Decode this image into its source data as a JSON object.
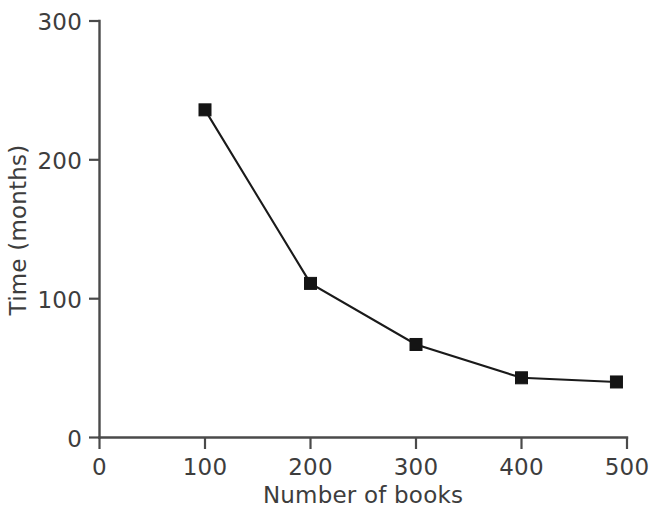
{
  "chart_data": {
    "type": "line",
    "title": "",
    "xlabel": "Number of books",
    "ylabel": "Time (months)",
    "xlim": [
      0,
      500
    ],
    "ylim": [
      0,
      300
    ],
    "grid": false,
    "legend": "none",
    "marker": "square",
    "line_color": "#1a1a1a",
    "marker_color": "#141414",
    "axis_color": "#4a4a4a",
    "text_color": "#3d3d3d",
    "x_ticks": [
      0,
      100,
      200,
      300,
      400,
      500
    ],
    "y_ticks": [
      0,
      100,
      200,
      300
    ],
    "x_tick_labels": [
      "0",
      "100",
      "200",
      "300",
      "400",
      "500"
    ],
    "y_tick_labels": [
      "0",
      "100",
      "200",
      "300"
    ],
    "x": [
      100,
      200,
      300,
      400,
      490
    ],
    "values": [
      236,
      111,
      67,
      43,
      40
    ],
    "series": [
      {
        "name": "Time",
        "points": [
          {
            "x": 100,
            "y": 236
          },
          {
            "x": 200,
            "y": 111
          },
          {
            "x": 300,
            "y": 67
          },
          {
            "x": 400,
            "y": 43
          },
          {
            "x": 490,
            "y": 40
          }
        ]
      }
    ]
  },
  "labels": {
    "x_axis_title": "Number of books",
    "y_axis_title": "Time (months)",
    "x_tick_0": "0",
    "x_tick_1": "100",
    "x_tick_2": "200",
    "x_tick_3": "300",
    "x_tick_4": "400",
    "x_tick_5": "500",
    "y_tick_0": "0",
    "y_tick_1": "100",
    "y_tick_2": "200",
    "y_tick_3": "300"
  }
}
